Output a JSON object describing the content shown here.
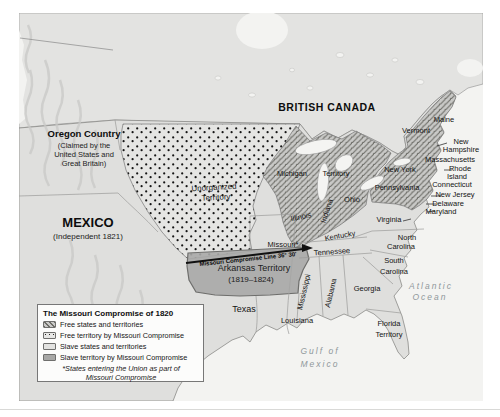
{
  "map": {
    "legend": {
      "title": "The Missouri Compromise of 1820",
      "items": [
        {
          "label": "Free states and territories",
          "swatch": "hatch"
        },
        {
          "label": "Free territory by Missouri Compromise",
          "swatch": "dots"
        },
        {
          "label": "Slave states and territories",
          "swatch": "plain"
        },
        {
          "label": "Slave territory by Missouri Compromise",
          "swatch": "dark"
        }
      ],
      "footnote_1": "*States entering the Union as part of",
      "footnote_2": "Missouri Compromise"
    },
    "colors": {
      "ocean": "#f3f3f1",
      "canada_land": "#e3e3e1",
      "us_land": "#dfdfdd",
      "free_hatch_bg": "#c9c9c7",
      "free_hatch_line": "#6a6a64",
      "free_territory_dots_bg": "#e5e5e3",
      "dot": "#141414",
      "slave_territory_fill": "#a9a9a7",
      "border_line": "#9b9b99",
      "compromise_line": "#111111",
      "water_label": "#8f979b"
    },
    "labels": [
      {
        "id": "oregon-country",
        "text": "Oregon Country",
        "x": 84,
        "y": 134,
        "size": 9.5,
        "style": "country"
      },
      {
        "id": "oregon-sub-1",
        "text": "(Claimed by the",
        "x": 84,
        "y": 146,
        "size": 7.5,
        "style": "sub"
      },
      {
        "id": "oregon-sub-2",
        "text": "United States and",
        "x": 84,
        "y": 155,
        "size": 7.5,
        "style": "sub"
      },
      {
        "id": "oregon-sub-3",
        "text": "Great Britain)",
        "x": 84,
        "y": 164,
        "size": 7.5,
        "style": "sub"
      },
      {
        "id": "mexico",
        "text": "MEXICO",
        "x": 88,
        "y": 222,
        "size": 13,
        "style": "country"
      },
      {
        "id": "mexico-sub",
        "text": "(Independent 1821)",
        "x": 88,
        "y": 237,
        "size": 8,
        "style": "sub"
      },
      {
        "id": "british-canada",
        "text": "BRITISH CANADA",
        "x": 327,
        "y": 107,
        "size": 10.5,
        "style": "country",
        "ls": 0.5
      },
      {
        "id": "unorganized-territory-1",
        "text": "Unorganized",
        "x": 214,
        "y": 188,
        "size": 8,
        "style": "sub",
        "rot": -3
      },
      {
        "id": "unorganized-territory-2",
        "text": "Territory",
        "x": 216,
        "y": 198,
        "size": 8,
        "style": "sub",
        "rot": -3
      },
      {
        "id": "michigan",
        "text": "Michigan",
        "x": 292,
        "y": 174,
        "size": 7.5,
        "style": "state"
      },
      {
        "id": "michigan-territory",
        "text": "Territory",
        "x": 336,
        "y": 174,
        "size": 7.5,
        "style": "state"
      },
      {
        "id": "maine",
        "text": "Maine",
        "x": 444,
        "y": 120,
        "size": 7.5,
        "style": "state"
      },
      {
        "id": "vermont",
        "text": "Vermont",
        "x": 416,
        "y": 131,
        "size": 7.5,
        "style": "state"
      },
      {
        "id": "new-hampshire-1",
        "text": "New",
        "x": 461,
        "y": 142,
        "size": 7.5,
        "style": "state"
      },
      {
        "id": "new-hampshire-2",
        "text": "Hampshire",
        "x": 461,
        "y": 150,
        "size": 7.5,
        "style": "state"
      },
      {
        "id": "massachusetts",
        "text": "Massachusetts",
        "x": 450,
        "y": 160,
        "size": 7.5,
        "style": "state"
      },
      {
        "id": "new-york",
        "text": "New York",
        "x": 400,
        "y": 170,
        "size": 7.5,
        "style": "state"
      },
      {
        "id": "rhode-island-1",
        "text": "Rhode",
        "x": 460,
        "y": 169,
        "size": 7.5,
        "style": "state"
      },
      {
        "id": "rhode-island-2",
        "text": "Island",
        "x": 457,
        "y": 177,
        "size": 7.5,
        "style": "state"
      },
      {
        "id": "connecticut",
        "text": "Connecticut",
        "x": 452,
        "y": 185,
        "size": 7.5,
        "style": "state"
      },
      {
        "id": "new-jersey",
        "text": "New Jersey",
        "x": 455,
        "y": 195,
        "size": 7.5,
        "style": "state"
      },
      {
        "id": "pennsylvania",
        "text": "Pennsylvania",
        "x": 397,
        "y": 188,
        "size": 7.5,
        "style": "state"
      },
      {
        "id": "delaware",
        "text": "Delaware",
        "x": 448,
        "y": 204,
        "size": 7.5,
        "style": "state"
      },
      {
        "id": "maryland",
        "text": "Maryland",
        "x": 441,
        "y": 212,
        "size": 7.5,
        "style": "state"
      },
      {
        "id": "ohio",
        "text": "Ohio",
        "x": 352,
        "y": 200,
        "size": 7.5,
        "style": "state"
      },
      {
        "id": "indiana",
        "text": "Indiana",
        "x": 327,
        "y": 211,
        "size": 7.5,
        "style": "state",
        "rot": -72
      },
      {
        "id": "illinois",
        "text": "Illinois",
        "x": 301,
        "y": 217,
        "size": 7.5,
        "style": "state",
        "rot": -12
      },
      {
        "id": "virginia",
        "text": "Virginia",
        "x": 389,
        "y": 220,
        "size": 7.5,
        "style": "state"
      },
      {
        "id": "kentucky",
        "text": "Kentucky",
        "x": 340,
        "y": 236,
        "size": 7.5,
        "style": "state",
        "rot": -10
      },
      {
        "id": "missouri",
        "text": "Missouri*",
        "x": 283,
        "y": 245,
        "size": 7.5,
        "style": "state"
      },
      {
        "id": "tennessee",
        "text": "Tennessee",
        "x": 332,
        "y": 252,
        "size": 7.5,
        "style": "state",
        "rot": -4
      },
      {
        "id": "north-carolina-1",
        "text": "North",
        "x": 407,
        "y": 238,
        "size": 7.5,
        "style": "state"
      },
      {
        "id": "north-carolina-2",
        "text": "Carolina",
        "x": 401,
        "y": 247,
        "size": 7.5,
        "style": "state"
      },
      {
        "id": "south-carolina-1",
        "text": "South",
        "x": 394,
        "y": 261,
        "size": 7.5,
        "style": "state"
      },
      {
        "id": "south-carolina-2",
        "text": "Carolina",
        "x": 394,
        "y": 272,
        "size": 7.5,
        "style": "state"
      },
      {
        "id": "georgia",
        "text": "Georgia",
        "x": 367,
        "y": 289,
        "size": 7.5,
        "style": "state"
      },
      {
        "id": "mississippi",
        "text": "Mississippi",
        "x": 304,
        "y": 292,
        "size": 7.5,
        "style": "state",
        "rot": -77
      },
      {
        "id": "alabama",
        "text": "Alabama",
        "x": 331,
        "y": 293,
        "size": 7.5,
        "style": "state",
        "rot": -77
      },
      {
        "id": "louisiana",
        "text": "Louisiana",
        "x": 297,
        "y": 321,
        "size": 7.5,
        "style": "state"
      },
      {
        "id": "florida-territory-1",
        "text": "Florida",
        "x": 389,
        "y": 324,
        "size": 7.5,
        "style": "state"
      },
      {
        "id": "florida-territory-2",
        "text": "Territory",
        "x": 389,
        "y": 335,
        "size": 7.5,
        "style": "state"
      },
      {
        "id": "texas",
        "text": "Texas",
        "x": 244,
        "y": 309,
        "size": 9,
        "style": "state"
      },
      {
        "id": "arkansas-territory",
        "text": "Arkansas Territory",
        "x": 254,
        "y": 268,
        "size": 9,
        "style": "sub"
      },
      {
        "id": "arkansas-territory-years",
        "text": "(1819–1824)",
        "x": 251,
        "y": 280,
        "size": 8,
        "style": "sub"
      },
      {
        "id": "missouri-compromise-line",
        "text": "Missouri Compromise Line 36° 30'",
        "x": 248,
        "y": 259,
        "size": 6,
        "style": "line",
        "rot": -6
      },
      {
        "id": "atlantic-ocean-1",
        "text": "Atlantic",
        "x": 431,
        "y": 286,
        "size": 8.5,
        "style": "water"
      },
      {
        "id": "atlantic-ocean-2",
        "text": "Ocean",
        "x": 430,
        "y": 297,
        "size": 8.5,
        "style": "water"
      },
      {
        "id": "gulf-of-mexico-1",
        "text": "Gulf of",
        "x": 320,
        "y": 351,
        "size": 8.5,
        "style": "water"
      },
      {
        "id": "gulf-of-mexico-2",
        "text": "Mexico",
        "x": 320,
        "y": 364,
        "size": 8.5,
        "style": "water"
      }
    ]
  }
}
